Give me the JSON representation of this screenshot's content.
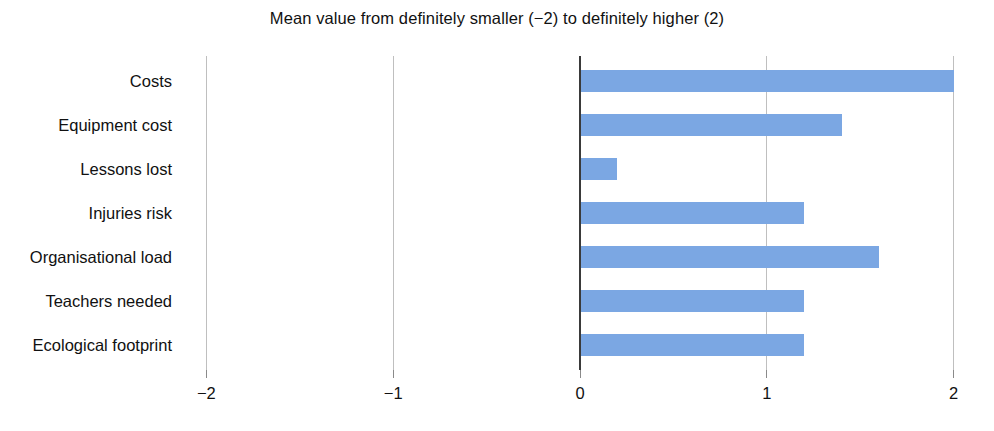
{
  "chart_data": {
    "type": "bar",
    "orientation": "horizontal",
    "title": "Mean value from definitely smaller (−2) to definitely higher (2)",
    "xlabel": "",
    "ylabel": "",
    "xlim": [
      -2,
      2
    ],
    "xticks": [
      -2,
      -1,
      0,
      1,
      2
    ],
    "xtick_labels": [
      "−2",
      "−1",
      "0",
      "1",
      "2"
    ],
    "grid": true,
    "grid_axis": "x",
    "legend": "none",
    "bar_color": "#7BA7E3",
    "zero_axis_color": "#3a3a3a",
    "gridline_color": "#bfbfbf",
    "categories": [
      "Costs",
      "Equipment cost",
      "Lessons lost",
      "Injuries risk",
      "Organisational load",
      "Teachers needed",
      "Ecological footprint"
    ],
    "values": [
      2.0,
      1.4,
      0.2,
      1.2,
      1.6,
      1.2,
      1.2
    ],
    "bars": [
      {
        "category": "Costs",
        "value": 2.0
      },
      {
        "category": "Equipment cost",
        "value": 1.4
      },
      {
        "category": "Lessons lost",
        "value": 0.2
      },
      {
        "category": "Injuries risk",
        "value": 1.2
      },
      {
        "category": "Organisational load",
        "value": 1.6
      },
      {
        "category": "Teachers needed",
        "value": 1.2
      },
      {
        "category": "Ecological footprint",
        "value": 1.2
      }
    ]
  }
}
